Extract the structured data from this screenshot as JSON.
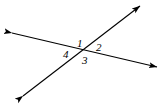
{
  "figure": {
    "type": "geometry-diagram",
    "background_color": "#ffffff",
    "stroke_color": "#000000",
    "stroke_width": 1.1,
    "canvas": {
      "width": 168,
      "height": 105
    },
    "intersection_point": {
      "x": 82,
      "y": 52
    },
    "lines": [
      {
        "name": "line-shallow",
        "from": {
          "x": 12,
          "y": 33
        },
        "to": {
          "x": 157,
          "y": 67
        },
        "arrow_start": true,
        "arrow_end": true
      },
      {
        "name": "line-steep",
        "from": {
          "x": 23,
          "y": 96
        },
        "to": {
          "x": 140,
          "y": 6
        },
        "arrow_start": true,
        "arrow_end": true
      }
    ],
    "labels": [
      {
        "id": "1",
        "text": "1",
        "position": "above-vertex",
        "x": 80,
        "y": 44
      },
      {
        "id": "2",
        "text": "2",
        "position": "right-of-vertex",
        "x": 99,
        "y": 48
      },
      {
        "id": "3",
        "text": "3",
        "position": "below-vertex",
        "x": 86,
        "y": 61
      },
      {
        "id": "4",
        "text": "4",
        "position": "left-of-vertex",
        "x": 66,
        "y": 55
      }
    ]
  }
}
